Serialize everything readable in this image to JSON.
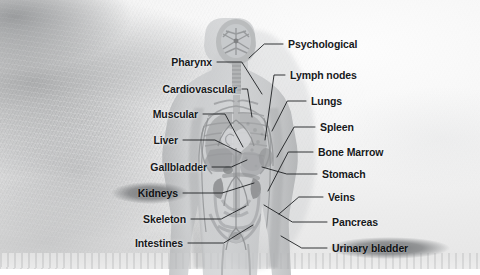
{
  "diagram": {
    "style": "grayscale textured anatomical illustration with leader-line callouts",
    "colors": {
      "background_light": "#f6f6f6",
      "background_smudge": "#8e9092",
      "label_text": "#17191b",
      "leader_line": "#1d1f21",
      "highlight_ellipse": "#70727480",
      "body_fill": "#b9bbbd",
      "organ_shadow": "#8d8f91"
    },
    "highlighted_labels": [
      "Kidneys",
      "Urinary bladder"
    ],
    "labels_left": [
      {
        "id": "pharynx",
        "text": "Pharynx",
        "x": 212,
        "y": 62,
        "tx": 262,
        "ty": 94,
        "highlight": false
      },
      {
        "id": "cardiovascular",
        "text": "Cardiovascular",
        "x": 237,
        "y": 89,
        "tx": 252,
        "ty": 117,
        "highlight": false
      },
      {
        "id": "muscular",
        "text": "Muscular",
        "x": 198,
        "y": 114,
        "tx": 243,
        "ty": 147,
        "highlight": false
      },
      {
        "id": "liver",
        "text": "Liver",
        "x": 178,
        "y": 140,
        "tx": 241,
        "ty": 153,
        "highlight": false
      },
      {
        "id": "gallbladder",
        "text": "Gallbladder",
        "x": 207,
        "y": 167,
        "tx": 247,
        "ty": 160,
        "highlight": false
      },
      {
        "id": "kidneys",
        "text": "Kidneys",
        "x": 178,
        "y": 193,
        "tx": 254,
        "ty": 183,
        "highlight": true
      },
      {
        "id": "skeleton",
        "text": "Skeleton",
        "x": 186,
        "y": 219,
        "tx": 246,
        "ty": 206,
        "highlight": false
      },
      {
        "id": "intestines",
        "text": "Intestines",
        "x": 183,
        "y": 243,
        "tx": 253,
        "ty": 225,
        "highlight": false
      }
    ],
    "labels_right": [
      {
        "id": "psychological",
        "text": "Psychological",
        "x": 288,
        "y": 44,
        "tx": 249,
        "ty": 58,
        "highlight": false
      },
      {
        "id": "lymph-nodes",
        "text": "Lymph nodes",
        "x": 290,
        "y": 75,
        "tx": 265,
        "ty": 140,
        "highlight": false
      },
      {
        "id": "lungs",
        "text": "Lungs",
        "x": 311,
        "y": 101,
        "tx": 272,
        "ty": 131,
        "highlight": false
      },
      {
        "id": "spleen",
        "text": "Spleen",
        "x": 320,
        "y": 127,
        "tx": 277,
        "ty": 157,
        "highlight": false
      },
      {
        "id": "bone-marrow",
        "text": "Bone Marrow",
        "x": 318,
        "y": 152,
        "tx": 268,
        "ty": 191,
        "highlight": false
      },
      {
        "id": "stomach",
        "text": "Stomach",
        "x": 322,
        "y": 174,
        "tx": 262,
        "ty": 167,
        "highlight": false
      },
      {
        "id": "veins",
        "text": "Veins",
        "x": 328,
        "y": 197,
        "tx": 279,
        "ty": 214,
        "highlight": false
      },
      {
        "id": "pancreas",
        "text": "Pancreas",
        "x": 332,
        "y": 222,
        "tx": 264,
        "ty": 205,
        "highlight": false
      },
      {
        "id": "urinary-bladder",
        "text": "Urinary bladder",
        "x": 332,
        "y": 248,
        "tx": 281,
        "ty": 236,
        "highlight": true
      }
    ]
  }
}
